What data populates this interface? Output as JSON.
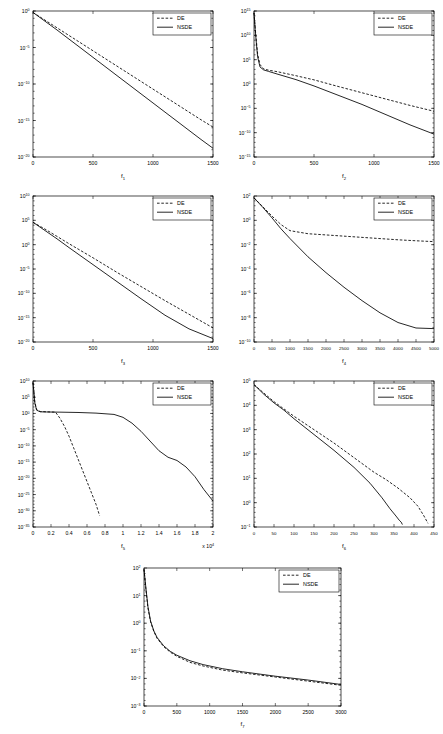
{
  "figure": {
    "background": "#ffffff",
    "line_color": "#000000",
    "panel_count": 7
  },
  "legend": {
    "entries": [
      {
        "label": "DE",
        "style": "dashed"
      },
      {
        "label": "NSDE",
        "style": "solid"
      }
    ]
  },
  "chart_data": [
    {
      "type": "line",
      "id": "panel1",
      "title": "",
      "xlabel": "f1",
      "xlabel_base": "f",
      "xlabel_sub": "1",
      "ylabel": "",
      "yscale": "log",
      "xlim": [
        0,
        1500
      ],
      "ylim": [
        1e-20,
        1
      ],
      "xticks": [
        0,
        500,
        1000,
        1500
      ],
      "xticklabels": [
        "0",
        "500",
        "1000",
        "1500"
      ],
      "yticks": [
        0,
        -5,
        -10,
        -15,
        -20
      ],
      "yticklabels": [
        "10^0",
        "10^-5",
        "10^-10",
        "10^-15",
        "10^-20"
      ],
      "grid": false,
      "legend_position": "top-right",
      "series": [
        {
          "name": "DE",
          "style": "dashed",
          "x": [
            0,
            100,
            200,
            300,
            400,
            500,
            600,
            700,
            800,
            900,
            1000,
            1100,
            1200,
            1300,
            1400,
            1500
          ],
          "y_log10": [
            -0.2,
            -1.25,
            -2.3,
            -3.35,
            -4.4,
            -5.45,
            -6.5,
            -7.55,
            -8.6,
            -9.65,
            -10.7,
            -11.75,
            -12.8,
            -13.85,
            -14.9,
            -15.9
          ]
        },
        {
          "name": "NSDE",
          "style": "solid",
          "x": [
            0,
            100,
            200,
            300,
            400,
            500,
            600,
            700,
            800,
            900,
            1000,
            1100,
            1200,
            1300,
            1400,
            1500
          ],
          "y_log10": [
            -0.2,
            -1.4,
            -2.6,
            -3.85,
            -5.1,
            -6.35,
            -7.6,
            -8.85,
            -10.1,
            -11.35,
            -12.6,
            -13.85,
            -15.1,
            -16.35,
            -17.6,
            -18.8
          ]
        }
      ]
    },
    {
      "type": "line",
      "id": "panel2",
      "title": "",
      "xlabel": "f2",
      "xlabel_base": "f",
      "xlabel_sub": "2",
      "ylabel": "",
      "yscale": "log",
      "xlim": [
        0,
        1500
      ],
      "ylim": [
        1e-15,
        1000000000000000.0
      ],
      "xticks": [
        0,
        500,
        1000,
        1500
      ],
      "xticklabels": [
        "0",
        "500",
        "1000",
        "1500"
      ],
      "yticks": [
        15,
        10,
        5,
        0,
        -5,
        -10,
        -15
      ],
      "yticklabels": [
        "10^15",
        "10^10",
        "10^5",
        "10^0",
        "10^-5",
        "10^-10",
        "10^-15"
      ],
      "grid": false,
      "legend_position": "top-right",
      "series": [
        {
          "name": "DE",
          "style": "dashed",
          "x": [
            0,
            10,
            20,
            30,
            50,
            80,
            120,
            200,
            350,
            500,
            700,
            900,
            1100,
            1300,
            1500
          ],
          "y_log10": [
            14.6,
            11.5,
            8.8,
            6.2,
            4.0,
            3.1,
            2.85,
            2.5,
            1.7,
            0.85,
            -0.5,
            -1.8,
            -3.1,
            -4.4,
            -5.6
          ]
        },
        {
          "name": "NSDE",
          "style": "solid",
          "x": [
            0,
            10,
            20,
            30,
            50,
            80,
            120,
            200,
            350,
            500,
            700,
            900,
            1100,
            1300,
            1500
          ],
          "y_log10": [
            14.6,
            11.2,
            8.3,
            5.6,
            3.5,
            2.9,
            2.6,
            2.0,
            0.9,
            -0.4,
            -2.3,
            -4.2,
            -6.3,
            -8.4,
            -10.3
          ]
        }
      ]
    },
    {
      "type": "line",
      "id": "panel3",
      "title": "",
      "xlabel": "f3",
      "xlabel_base": "f",
      "xlabel_sub": "3",
      "ylabel": "",
      "yscale": "log",
      "xlim": [
        0,
        1500
      ],
      "ylim": [
        1e-20,
        10000000000.0
      ],
      "xticks": [
        0,
        500,
        1000,
        1500
      ],
      "xticklabels": [
        "0",
        "500",
        "1000",
        "1500"
      ],
      "yticks": [
        10,
        5,
        0,
        -5,
        -10,
        -15,
        -20
      ],
      "yticklabels": [
        "10^10",
        "10^5",
        "10^0",
        "10^-5",
        "10^-10",
        "10^-15",
        "10^-20"
      ],
      "grid": false,
      "legend_position": "top-right",
      "series": [
        {
          "name": "DE",
          "style": "dashed",
          "x": [
            0,
            100,
            200,
            300,
            500,
            700,
            900,
            1100,
            1300,
            1500
          ],
          "y_log10": [
            4.6,
            3.2,
            1.7,
            0.2,
            -2.7,
            -5.7,
            -8.6,
            -11.5,
            -14.3,
            -17.1
          ]
        },
        {
          "name": "NSDE",
          "style": "solid",
          "x": [
            0,
            100,
            200,
            300,
            500,
            700,
            900,
            1100,
            1300,
            1500
          ],
          "y_log10": [
            4.6,
            2.9,
            1.2,
            -0.6,
            -4.1,
            -7.6,
            -11.1,
            -14.5,
            -17.3,
            -19.3
          ]
        }
      ]
    },
    {
      "type": "line",
      "id": "panel4",
      "title": "",
      "xlabel": "f4",
      "xlabel_base": "f",
      "xlabel_sub": "4",
      "ylabel": "",
      "yscale": "log",
      "xlim": [
        0,
        5000
      ],
      "ylim": [
        1e-10,
        100
      ],
      "xticks": [
        0,
        500,
        1000,
        1500,
        2000,
        2500,
        3000,
        3500,
        4000,
        4500,
        5000
      ],
      "xticklabels": [
        "0",
        "500",
        "1000",
        "1500",
        "2000",
        "2500",
        "3000",
        "3500",
        "4000",
        "4500",
        "5000"
      ],
      "yticks": [
        2,
        0,
        -2,
        -4,
        -6,
        -8,
        -10
      ],
      "yticklabels": [
        "10^2",
        "10^0",
        "10^-2",
        "10^-4",
        "10^-6",
        "10^-8",
        "10^-10"
      ],
      "grid": false,
      "legend_position": "top-right",
      "series": [
        {
          "name": "DE",
          "style": "dashed",
          "x": [
            0,
            250,
            500,
            750,
            1000,
            1500,
            2000,
            2500,
            3000,
            3500,
            4000,
            4500,
            5000
          ],
          "y_log10": [
            1.85,
            1.1,
            0.35,
            -0.35,
            -0.85,
            -1.1,
            -1.2,
            -1.3,
            -1.4,
            -1.5,
            -1.6,
            -1.68,
            -1.75
          ]
        },
        {
          "name": "NSDE",
          "style": "solid",
          "x": [
            0,
            250,
            500,
            750,
            1000,
            1500,
            2000,
            2500,
            3000,
            3500,
            4000,
            4500,
            5000
          ],
          "y_log10": [
            1.85,
            1.05,
            0.2,
            -0.7,
            -1.5,
            -3.0,
            -4.3,
            -5.5,
            -6.6,
            -7.6,
            -8.4,
            -8.85,
            -8.9
          ]
        }
      ]
    },
    {
      "type": "line",
      "id": "panel5",
      "title": "",
      "xlabel": "f5",
      "xlabel_base": "f",
      "xlabel_sub": "5",
      "ylabel": "",
      "yscale": "log",
      "xlim": [
        0,
        20000
      ],
      "ylim": [
        1e-35,
        10000000000.0
      ],
      "x_multiplier": "x 10^4",
      "xticks": [
        0,
        2000,
        4000,
        6000,
        8000,
        10000,
        12000,
        14000,
        16000,
        18000,
        20000
      ],
      "xticklabels": [
        "0",
        "0.2",
        "0.4",
        "0.6",
        "0.8",
        "1",
        "1.2",
        "1.4",
        "1.6",
        "1.8",
        "2"
      ],
      "yticks": [
        10,
        5,
        0,
        -5,
        -10,
        -15,
        -20,
        -25,
        -30,
        -35
      ],
      "yticklabels": [
        "10^10",
        "10^5",
        "10^0",
        "10^-5",
        "10^-10",
        "10^-15",
        "10^-20",
        "10^-25",
        "10^-30",
        "10^-35"
      ],
      "grid": false,
      "legend_position": "top-right",
      "series": [
        {
          "name": "DE",
          "style": "dashed",
          "x": [
            0,
            200,
            400,
            800,
            1500,
            2500,
            3000,
            3500,
            4000,
            4500,
            5000,
            5500,
            6000,
            6500,
            7000,
            7400
          ],
          "y_log10": [
            9.5,
            3.5,
            1.2,
            0.6,
            0.5,
            0.4,
            -1.5,
            -4.0,
            -7.0,
            -10.5,
            -14.0,
            -17.5,
            -21.0,
            -24.5,
            -28.0,
            -31.5
          ]
        },
        {
          "name": "NSDE",
          "style": "solid",
          "x": [
            0,
            200,
            400,
            800,
            1500,
            3000,
            5000,
            7000,
            9000,
            10000,
            11000,
            12000,
            13000,
            14000,
            15000,
            16000,
            17000,
            18000,
            19000,
            20000
          ],
          "y_log10": [
            9.5,
            3.3,
            1.0,
            0.5,
            0.45,
            0.4,
            0.3,
            0.1,
            -0.3,
            -1.2,
            -3.0,
            -5.5,
            -8.5,
            -11.5,
            -13.5,
            -14.5,
            -16.5,
            -19.5,
            -23.5,
            -27.0
          ]
        }
      ]
    },
    {
      "type": "line",
      "id": "panel6",
      "title": "",
      "xlabel": "f6",
      "xlabel_base": "f",
      "xlabel_sub": "6",
      "ylabel": "",
      "yscale": "log",
      "xlim": [
        0,
        450
      ],
      "ylim": [
        0.1,
        100000
      ],
      "xticks": [
        0,
        50,
        100,
        150,
        200,
        250,
        300,
        350,
        400,
        450
      ],
      "xticklabels": [
        "0",
        "50",
        "100",
        "150",
        "200",
        "250",
        "300",
        "350",
        "400",
        "450"
      ],
      "yticks": [
        5,
        4,
        3,
        2,
        1,
        0,
        -1
      ],
      "yticklabels": [
        "10^5",
        "10^4",
        "10^3",
        "10^2",
        "10^1",
        "10^0",
        "10^-1"
      ],
      "grid": false,
      "legend_position": "top-right",
      "series": [
        {
          "name": "DE",
          "style": "dashed",
          "x": [
            0,
            25,
            50,
            75,
            100,
            150,
            200,
            250,
            300,
            330,
            360,
            390,
            410,
            425,
            435
          ],
          "y_log10": [
            4.85,
            4.5,
            4.15,
            3.85,
            3.55,
            3.0,
            2.45,
            1.85,
            1.25,
            0.95,
            0.6,
            0.2,
            -0.15,
            -0.55,
            -0.85
          ]
        },
        {
          "name": "NSDE",
          "style": "solid",
          "x": [
            0,
            25,
            50,
            75,
            100,
            150,
            200,
            250,
            290,
            320,
            340,
            355,
            363,
            368,
            371
          ],
          "y_log10": [
            4.85,
            4.45,
            4.1,
            3.8,
            3.45,
            2.8,
            2.15,
            1.45,
            0.8,
            0.2,
            -0.25,
            -0.55,
            -0.72,
            -0.8,
            -0.9
          ]
        }
      ]
    },
    {
      "type": "line",
      "id": "panel7",
      "title": "",
      "xlabel": "f7",
      "xlabel_base": "f",
      "xlabel_sub": "7",
      "ylabel": "",
      "yscale": "log",
      "xlim": [
        0,
        3000
      ],
      "ylim": [
        0.001,
        100
      ],
      "xticks": [
        0,
        500,
        1000,
        1500,
        2000,
        2500,
        3000
      ],
      "xticklabels": [
        "0",
        "500",
        "1000",
        "1500",
        "2000",
        "2500",
        "3000"
      ],
      "yticks": [
        2,
        1,
        0,
        -1,
        -2,
        -3
      ],
      "yticklabels": [
        "10^2",
        "10^1",
        "10^0",
        "10^-1",
        "10^-2",
        "10^-3"
      ],
      "grid": false,
      "legend_position": "top-right",
      "series": [
        {
          "name": "DE",
          "style": "dashed",
          "x": [
            0,
            30,
            60,
            100,
            150,
            200,
            300,
            400,
            500,
            700,
            900,
            1200,
            1500,
            2000,
            2500,
            3000
          ],
          "y_log10": [
            1.95,
            1.2,
            0.55,
            0.05,
            -0.3,
            -0.55,
            -0.85,
            -1.05,
            -1.2,
            -1.42,
            -1.55,
            -1.7,
            -1.8,
            -1.95,
            -2.1,
            -2.25
          ]
        },
        {
          "name": "NSDE",
          "style": "solid",
          "x": [
            0,
            30,
            60,
            100,
            150,
            200,
            300,
            400,
            500,
            700,
            900,
            1200,
            1500,
            2000,
            2500,
            3000
          ],
          "y_log10": [
            1.95,
            1.25,
            0.6,
            0.08,
            -0.28,
            -0.52,
            -0.82,
            -1.02,
            -1.16,
            -1.36,
            -1.5,
            -1.65,
            -1.76,
            -1.92,
            -2.06,
            -2.22
          ]
        }
      ]
    }
  ]
}
